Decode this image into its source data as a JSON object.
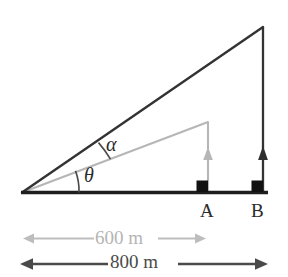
{
  "figure": {
    "background_color": "#ffffff",
    "colors": {
      "dark_line": "#333333",
      "gray_line": "#b0b0b0",
      "dark_text": "#2b2b2b",
      "gray_text": "#b4b4b4",
      "dim_dark_text": "#4a4a4a",
      "marker_fill": "#111111"
    },
    "angles": {
      "upper": {
        "symbol": "α",
        "name": "alpha-angle"
      },
      "lower": {
        "symbol": "θ",
        "name": "theta-angle"
      }
    },
    "points": {
      "a": {
        "label": "A",
        "name": "point-a"
      },
      "b": {
        "label": "B",
        "name": "point-b"
      }
    },
    "dimensions": [
      {
        "label": "600 m",
        "value": 600,
        "unit": "m",
        "color": "#b4b4b4",
        "spans_to": "A"
      },
      {
        "label": "800 m",
        "value": 800,
        "unit": "m",
        "color": "#4a4a4a",
        "spans_to": "B"
      }
    ],
    "icons": {
      "arrow_up_a": "arrow-up-icon",
      "arrow_up_b": "arrow-up-icon",
      "right_angle_a": "right-angle-marker-icon",
      "right_angle_b": "right-angle-marker-icon",
      "dim_arrow_left": "arrow-left-icon",
      "dim_arrow_right": "arrow-right-icon"
    }
  }
}
